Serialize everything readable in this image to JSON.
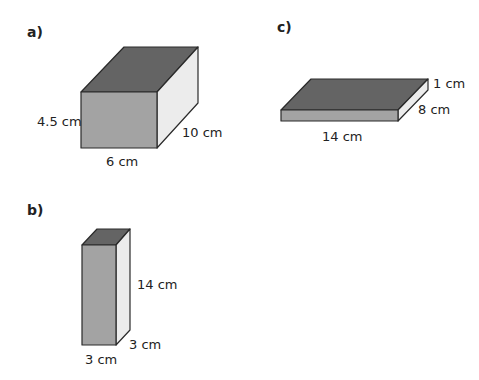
{
  "colors": {
    "top": "#646464",
    "front": "#a3a3a3",
    "side": "#ececec",
    "edge": "#2a2a2a"
  },
  "figures": [
    {
      "part": "a)",
      "labels": {
        "height": "4.5 cm",
        "depth": "10 cm",
        "width": "6 cm"
      }
    },
    {
      "part": "b)",
      "labels": {
        "height": "14 cm",
        "depth": "3 cm",
        "width": "3 cm"
      }
    },
    {
      "part": "c)",
      "labels": {
        "height": "1 cm",
        "depth": "8 cm",
        "width": "14 cm"
      }
    }
  ]
}
